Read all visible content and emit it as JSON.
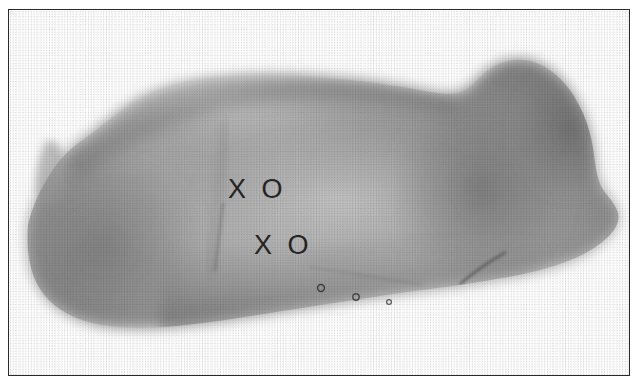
{
  "figure": {
    "kind": "halftone-photograph",
    "orientation": "head-right",
    "background_color": "#ffffff",
    "frame": {
      "visible": true,
      "color": "#2a2a2a",
      "thickness_px": 1
    }
  },
  "annotations": {
    "marks": [
      {
        "id": "upper",
        "label": "X O",
        "x": 228,
        "y": 176,
        "color": "#242424"
      },
      {
        "id": "lower",
        "label": "X O",
        "x": 254,
        "y": 232,
        "color": "#242424"
      }
    ]
  },
  "anatomy": {
    "body_tone_mid": "#9a9a9a",
    "body_tone_light": "#cfcfcf",
    "body_tone_dark": "#6f6f6f",
    "teat_color": "#4a4a4a",
    "teats": [
      {
        "x": 311,
        "y": 277,
        "r": 3.4
      },
      {
        "x": 346,
        "y": 286,
        "r": 3.2
      },
      {
        "x": 379,
        "y": 291,
        "r": 2.4
      }
    ],
    "creases": [
      {
        "id": "rear-flank-fold",
        "from_x": 212,
        "from_y": 196,
        "to_x": 206,
        "to_y": 258
      },
      {
        "id": "foreleg-elbow-line",
        "from_x": 494,
        "from_y": 243,
        "to_x": 452,
        "to_y": 272
      }
    ]
  }
}
